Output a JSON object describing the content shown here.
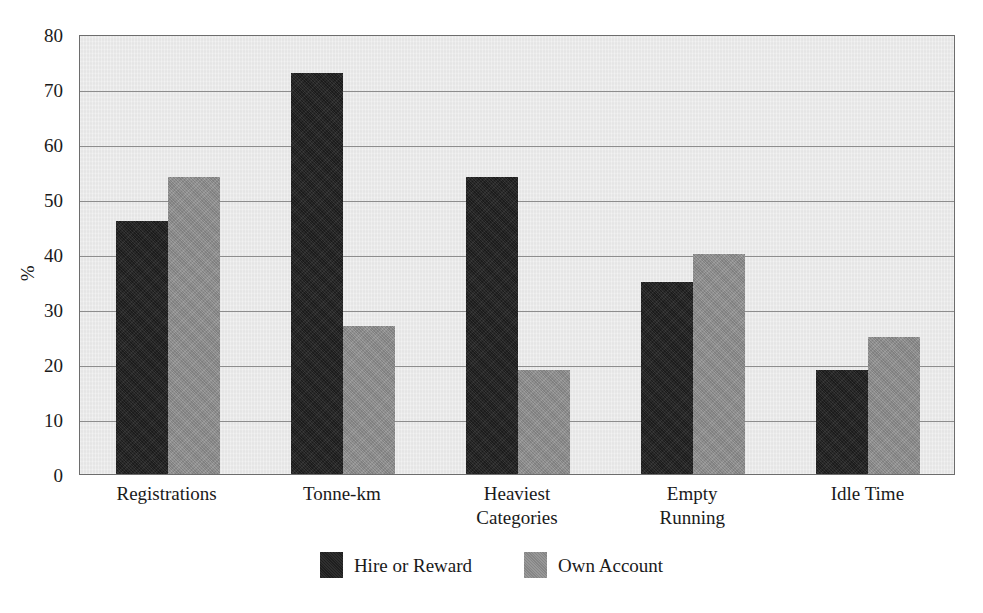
{
  "chart_data": {
    "type": "bar",
    "title": "",
    "subtitle": "",
    "xlabel": "",
    "ylabel": "%",
    "ylim": [
      0,
      80
    ],
    "ytick_step": 10,
    "yticks": [
      80,
      70,
      60,
      50,
      40,
      30,
      20,
      10,
      0
    ],
    "grid": true,
    "legend_position": "bottom-center",
    "categories": [
      "Registrations",
      "Tonne-km",
      "Heaviest\nCategories",
      "Empty\nRunning",
      "Idle Time"
    ],
    "series": [
      {
        "name": "Hire or Reward",
        "color": "#232323",
        "values": [
          46,
          73,
          54,
          35,
          19
        ]
      },
      {
        "name": "Own Account",
        "color": "#8c8c8c",
        "values": [
          54,
          27,
          19,
          40,
          25
        ]
      }
    ]
  },
  "style": {
    "plot_background": "#e9e9e9",
    "page_background": "#ffffff",
    "gridline_color": "#8d8d8d",
    "axis_color": "#6d6d6d",
    "text_color": "#1a1a1a"
  }
}
